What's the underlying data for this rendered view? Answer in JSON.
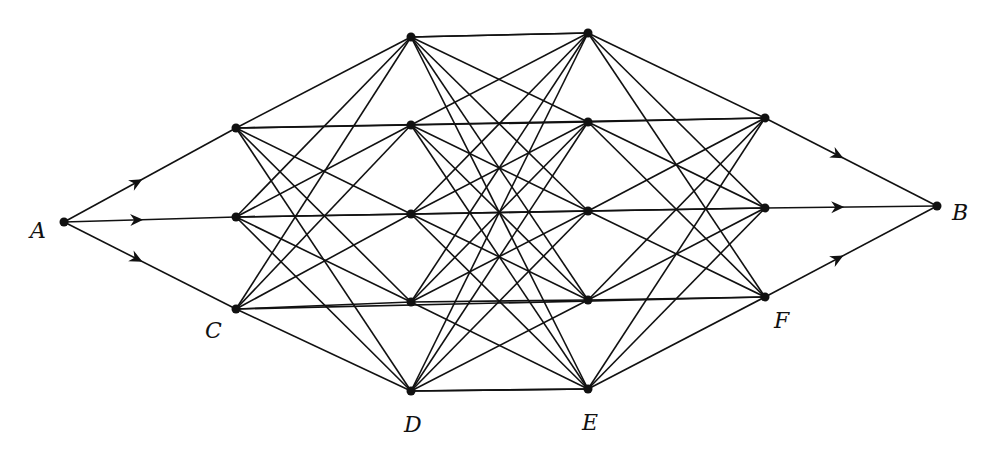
{
  "diagram": {
    "type": "layered-network",
    "nodes": [
      {
        "id": "A",
        "label": "A",
        "x": 64,
        "y": 222,
        "lx": 30,
        "ly": 218
      },
      {
        "id": "C1",
        "label": "",
        "x": 236,
        "y": 128
      },
      {
        "id": "C2",
        "label": "",
        "x": 236,
        "y": 217
      },
      {
        "id": "C3",
        "label": "C",
        "x": 236,
        "y": 309,
        "lx": 205,
        "ly": 318
      },
      {
        "id": "D1",
        "label": "",
        "x": 411,
        "y": 37
      },
      {
        "id": "D2",
        "label": "",
        "x": 411,
        "y": 125
      },
      {
        "id": "D3",
        "label": "",
        "x": 411,
        "y": 214
      },
      {
        "id": "D4",
        "label": "",
        "x": 411,
        "y": 302
      },
      {
        "id": "D5",
        "label": "D",
        "x": 411,
        "y": 391,
        "lx": 404,
        "ly": 412
      },
      {
        "id": "E1",
        "label": "",
        "x": 588,
        "y": 33
      },
      {
        "id": "E2",
        "label": "",
        "x": 588,
        "y": 122
      },
      {
        "id": "E3",
        "label": "",
        "x": 588,
        "y": 211
      },
      {
        "id": "E4",
        "label": "",
        "x": 588,
        "y": 300
      },
      {
        "id": "E5",
        "label": "E",
        "x": 588,
        "y": 389,
        "lx": 582,
        "ly": 410
      },
      {
        "id": "F1",
        "label": "",
        "x": 765,
        "y": 118
      },
      {
        "id": "F2",
        "label": "",
        "x": 765,
        "y": 208
      },
      {
        "id": "F3",
        "label": "F",
        "x": 765,
        "y": 297,
        "lx": 774,
        "ly": 308
      },
      {
        "id": "B",
        "label": "B",
        "x": 937,
        "y": 206,
        "lx": 952,
        "ly": 200
      }
    ],
    "layers": [
      [
        "A"
      ],
      [
        "C1",
        "C2",
        "C3"
      ],
      [
        "D1",
        "D2",
        "D3",
        "D4",
        "D5"
      ],
      [
        "E1",
        "E2",
        "E3",
        "E4",
        "E5"
      ],
      [
        "F1",
        "F2",
        "F3"
      ],
      [
        "B"
      ]
    ],
    "arrowed_edges": [
      [
        "A",
        "C1"
      ],
      [
        "A",
        "C2"
      ],
      [
        "A",
        "C3"
      ],
      [
        "F1",
        "B"
      ],
      [
        "F2",
        "B"
      ],
      [
        "F3",
        "B"
      ]
    ],
    "extra_edges": [
      [
        "D1",
        "E1"
      ],
      [
        "D5",
        "E5"
      ],
      [
        "C1",
        "F1"
      ],
      [
        "C2",
        "F2"
      ],
      [
        "C3",
        "F3"
      ]
    ],
    "colors": {
      "line": "#111111",
      "node": "#111111",
      "background": "#ffffff"
    }
  }
}
